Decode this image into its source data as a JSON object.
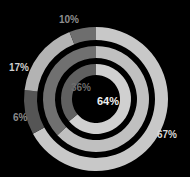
{
  "chart_data": {
    "type": "pie",
    "title": "",
    "subtitle": "",
    "xlabel": "",
    "ylabel": "",
    "legend_position": "none",
    "grid": false,
    "background_color": "#000000",
    "center_x": 96,
    "center_y": 99,
    "start_angle_deg": 0,
    "direction": "clockwise",
    "rings": [
      {
        "name": "outer-ring",
        "radius": 72,
        "thickness": 13,
        "segments": [
          {
            "label": "67%",
            "value": 67,
            "color": "#c8c8c8"
          },
          {
            "label": "10%",
            "value": 10,
            "color": "#555555"
          },
          {
            "label": "17%",
            "value": 17,
            "color": "#b3b3b3"
          },
          {
            "label": "6%",
            "value": 6,
            "color": "#6e6e6e"
          }
        ]
      },
      {
        "name": "middle-ring",
        "radius": 53,
        "thickness": 12,
        "segments": [
          {
            "label": "",
            "value": 63,
            "color": "#c0c0c0"
          },
          {
            "label": "",
            "value": 37,
            "color": "#707070"
          }
        ]
      },
      {
        "name": "inner-ring",
        "radius": 35,
        "thickness": 11,
        "segments": [
          {
            "label": "64%",
            "value": 64,
            "color": "#d0d0d0"
          },
          {
            "label": "36%",
            "value": 36,
            "color": "#606060"
          }
        ]
      }
    ],
    "labels": [
      {
        "name": "outer-segment-label-67",
        "text": "67%",
        "value": 67,
        "color": "#d8d8d8"
      },
      {
        "name": "outer-segment-label-10",
        "text": "10%",
        "value": 10,
        "color": "#8e8e8e"
      },
      {
        "name": "outer-segment-label-17",
        "text": "17%",
        "value": 17,
        "color": "#cfcfcf"
      },
      {
        "name": "outer-segment-label-6",
        "text": "6%",
        "value": 6,
        "color": "#8a8a8a"
      },
      {
        "name": "inner-segment-label-64",
        "text": "64%",
        "value": 64,
        "color": "#f0f0f0"
      },
      {
        "name": "inner-segment-label-36",
        "text": "36%",
        "value": 36,
        "color": "#6d6d6d"
      }
    ]
  }
}
